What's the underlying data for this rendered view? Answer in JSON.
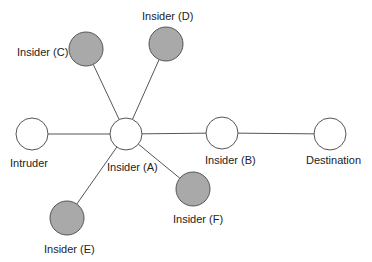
{
  "diagram": {
    "nodes": [
      {
        "id": "intruder",
        "label": "Intruder",
        "cx": 32,
        "cy": 134,
        "r": 16,
        "fill": "#ffffff",
        "lx": 10,
        "ly": 167
      },
      {
        "id": "insider-a",
        "label": "Insider (A)",
        "cx": 126,
        "cy": 134,
        "r": 16,
        "fill": "#ffffff",
        "lx": 107,
        "ly": 171
      },
      {
        "id": "insider-b",
        "label": "Insider (B)",
        "cx": 222,
        "cy": 133,
        "r": 16,
        "fill": "#ffffff",
        "lx": 205,
        "ly": 164
      },
      {
        "id": "destination",
        "label": "Destination",
        "cx": 330,
        "cy": 134,
        "r": 16,
        "fill": "#ffffff",
        "lx": 306,
        "ly": 164
      },
      {
        "id": "insider-c",
        "label": "Insider (C)",
        "cx": 86,
        "cy": 49,
        "r": 17,
        "fill": "#a9a9a9",
        "lx": 17,
        "ly": 56
      },
      {
        "id": "insider-d",
        "label": "Insider (D)",
        "cx": 166,
        "cy": 44,
        "r": 17,
        "fill": "#a9a9a9",
        "lx": 142,
        "ly": 20
      },
      {
        "id": "insider-e",
        "label": "Insider (E)",
        "cx": 67,
        "cy": 218,
        "r": 17,
        "fill": "#a9a9a9",
        "lx": 44,
        "ly": 253
      },
      {
        "id": "insider-f",
        "label": "Insider (F)",
        "cx": 193,
        "cy": 189,
        "r": 17,
        "fill": "#a9a9a9",
        "lx": 173,
        "ly": 223
      }
    ],
    "edges": [
      [
        "intruder",
        "insider-a"
      ],
      [
        "insider-a",
        "insider-b"
      ],
      [
        "insider-b",
        "destination"
      ],
      [
        "insider-a",
        "insider-c"
      ],
      [
        "insider-a",
        "insider-d"
      ],
      [
        "insider-a",
        "insider-e"
      ],
      [
        "insider-a",
        "insider-f"
      ]
    ],
    "colors": {
      "stroke": "#555555",
      "insider_fill": "#a9a9a9",
      "node_fill": "#ffffff"
    }
  }
}
